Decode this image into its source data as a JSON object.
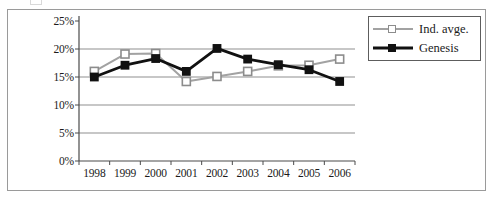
{
  "figure": {
    "legend_position": "top-right"
  },
  "chart_data": {
    "type": "line",
    "title": "",
    "subtitle": "",
    "xlabel": "",
    "ylabel": "",
    "categories": [
      "1998",
      "1999",
      "2000",
      "2001",
      "2002",
      "2003",
      "2004",
      "2005",
      "2006"
    ],
    "x": [
      1998,
      1999,
      2000,
      2001,
      2002,
      2003,
      2004,
      2005,
      2006
    ],
    "ylim": [
      0,
      25
    ],
    "ytick_labels": [
      "0%",
      "5%",
      "10%",
      "15%",
      "20%",
      "25%"
    ],
    "ytick_values": [
      0,
      5,
      10,
      15,
      20,
      25
    ],
    "ytick_suffix": "%",
    "grid": "horizontal",
    "gridlines_at": [
      5,
      10,
      15,
      20
    ],
    "series": [
      {
        "name": "Ind. avge.",
        "color": "#a2a2a2",
        "marker": "square-hollow",
        "values": [
          16.0,
          19.1,
          19.2,
          14.2,
          15.1,
          16.0,
          17.0,
          17.1,
          18.2
        ]
      },
      {
        "name": "Genesis",
        "color": "#111111",
        "marker": "square-filled",
        "values": [
          15.0,
          17.1,
          18.3,
          16.0,
          20.1,
          18.2,
          17.2,
          16.3,
          14.2
        ]
      }
    ],
    "legend": [
      "Ind. avge.",
      "Genesis"
    ],
    "annotations": []
  }
}
